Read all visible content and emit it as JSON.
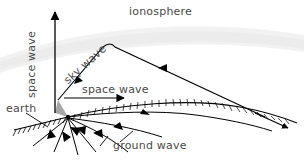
{
  "figure": {
    "background_color": "#ffffff",
    "line_color": "#000000",
    "text_color": "#4a4a4a",
    "ionosphere_color": "#f0f0f0"
  },
  "labels": {
    "ionosphere": "ionosphere",
    "space_wave_vertical": "space wave",
    "sky_wave": "sky wave",
    "space_wave_horizontal": "space wave",
    "earth": "earth",
    "ground_wave": "ground wave"
  }
}
